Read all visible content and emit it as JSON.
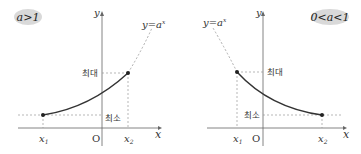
{
  "left_panel": {
    "badge": "a>1",
    "curve_label": "y=a",
    "curve_label_exp": "x",
    "axis_y": "y",
    "axis_x": "x",
    "origin": "O",
    "max_label": "최대",
    "min_label": "최소",
    "x1": "x",
    "x1_sub": "1",
    "x2": "x",
    "x2_sub": "2"
  },
  "right_panel": {
    "badge": "0<a<1",
    "curve_label": "y=a",
    "curve_label_exp": "x",
    "axis_y": "y",
    "axis_x": "x",
    "origin": "O",
    "max_label": "최대",
    "min_label": "최소",
    "x1": "x",
    "x1_sub": "1",
    "x2": "x",
    "x2_sub": "2"
  },
  "colors": {
    "curve": "#333333",
    "axis": "#666666",
    "dashed": "#999999",
    "badge_bg": "#d9d9d9"
  }
}
